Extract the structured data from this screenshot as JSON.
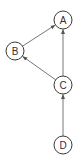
{
  "diagram": {
    "type": "directed-graph",
    "nodes": [
      {
        "id": "A",
        "label": "A",
        "x": 63,
        "y": 20
      },
      {
        "id": "B",
        "label": "B",
        "x": 15,
        "y": 51
      },
      {
        "id": "C",
        "label": "C",
        "x": 63,
        "y": 85
      },
      {
        "id": "D",
        "label": "D",
        "x": 63,
        "y": 145
      }
    ],
    "edges": [
      {
        "from": "B",
        "to": "A"
      },
      {
        "from": "C",
        "to": "B"
      },
      {
        "from": "C",
        "to": "A"
      },
      {
        "from": "D",
        "to": "C"
      }
    ],
    "node_radius": 9,
    "colors": {
      "node_stroke": "#3a3a3a",
      "edge_stroke": "#777777",
      "label": "#333333",
      "background": "#ffffff"
    }
  }
}
